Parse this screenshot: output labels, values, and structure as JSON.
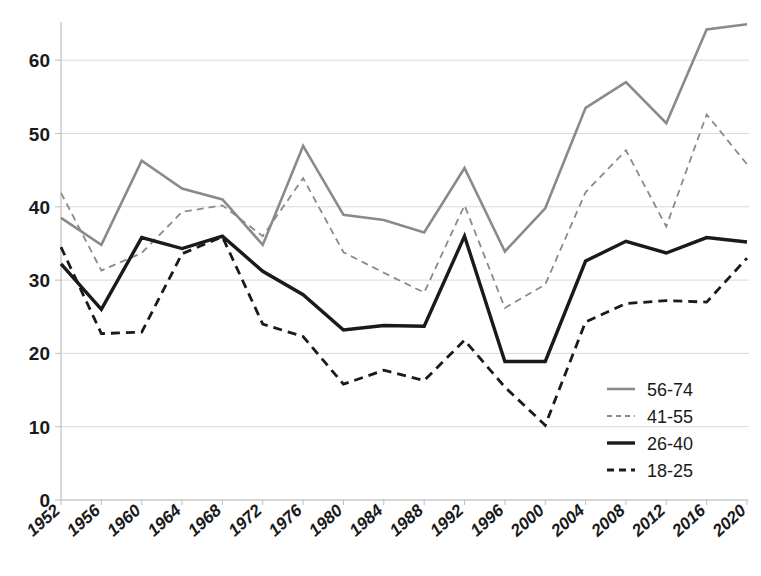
{
  "chart_data": {
    "type": "line",
    "title": "",
    "subtitle": "",
    "xlabel": "",
    "ylabel": "",
    "grid": true,
    "legend_position": "bottom-right",
    "xlim": [
      1952,
      2020
    ],
    "ylim": [
      0,
      68
    ],
    "y_ticks": [
      0,
      10,
      20,
      30,
      40,
      50,
      60
    ],
    "x": [
      1952,
      1956,
      1960,
      1964,
      1968,
      1972,
      1976,
      1980,
      1984,
      1988,
      1992,
      1996,
      2000,
      2004,
      2008,
      2012,
      2016,
      2020
    ],
    "categories": [
      "1952",
      "1956",
      "1960",
      "1964",
      "1968",
      "1972",
      "1976",
      "1980",
      "1984",
      "1988",
      "1992",
      "1996",
      "2000",
      "2004",
      "2008",
      "2012",
      "2016",
      "2020"
    ],
    "series": [
      {
        "name": "56-74",
        "style": "solid",
        "color": "#8a8a8a",
        "width": 2.6,
        "values": [
          38.5,
          34.8,
          46.3,
          42.5,
          41.0,
          34.8,
          48.3,
          38.9,
          38.2,
          36.5,
          45.3,
          33.9,
          39.8,
          53.5,
          57.0,
          51.4,
          64.2,
          64.9
        ]
      },
      {
        "name": "41-55",
        "style": "dashed",
        "color": "#8a8a8a",
        "width": 1.8,
        "values": [
          41.9,
          31.3,
          33.7,
          39.3,
          40.2,
          36.0,
          43.9,
          33.8,
          31.0,
          28.3,
          40.2,
          26.2,
          29.4,
          42.0,
          47.7,
          37.3,
          52.6,
          45.8
        ]
      },
      {
        "name": "26-40",
        "style": "solid",
        "color": "#1a1a1a",
        "width": 3.4,
        "values": [
          32.2,
          26.0,
          35.8,
          34.3,
          36.0,
          31.2,
          28.0,
          23.2,
          23.8,
          23.7,
          36.0,
          18.9,
          18.9,
          32.6,
          35.3,
          33.7,
          35.8,
          35.2
        ]
      },
      {
        "name": "18-25",
        "style": "dashed",
        "color": "#1a1a1a",
        "width": 2.8,
        "values": [
          34.5,
          22.7,
          22.9,
          33.6,
          35.9,
          24.0,
          22.3,
          15.8,
          17.7,
          16.3,
          21.8,
          15.4,
          10.2,
          24.3,
          26.8,
          27.2,
          27.0,
          33.0
        ]
      }
    ]
  },
  "legend": {
    "entries": [
      {
        "label": "56-74"
      },
      {
        "label": "41-55"
      },
      {
        "label": "26-40"
      },
      {
        "label": "18-25"
      }
    ]
  }
}
